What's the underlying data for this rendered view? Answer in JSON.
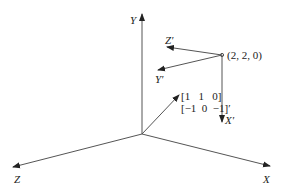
{
  "axes": {
    "x_label": "X",
    "y_label": "Y",
    "z_label": "Z"
  },
  "local_frame": {
    "origin_label": "(2, 2, 0)",
    "x_prime_label": "X′",
    "y_prime_label": "Y′",
    "z_prime_label": "Z′"
  },
  "vector": {
    "line1": "[1   1   0]",
    "line2": "[−1  0  −1]′"
  },
  "colors": {
    "line": "#555555",
    "text": "#222222"
  }
}
